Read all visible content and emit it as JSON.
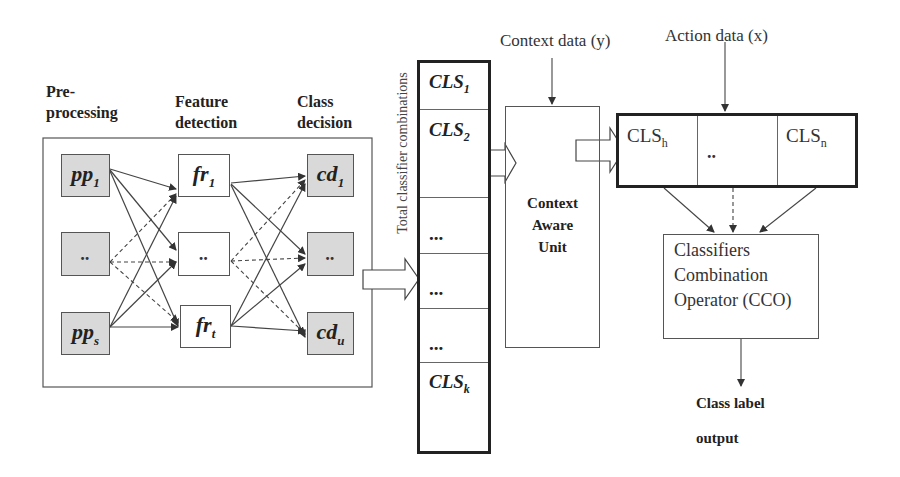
{
  "diagram": {
    "stage_labels": {
      "preprocessing_line1": "Pre-",
      "preprocessing_line2": "processing",
      "feature_line1": "Feature",
      "feature_line2": "detection",
      "class_line1": "Class",
      "class_line2": "decision"
    },
    "preprocessing_nodes": [
      {
        "base": "pp",
        "sub": "1"
      },
      {
        "base": "..",
        "sub": ""
      },
      {
        "base": "pp",
        "sub": "s"
      }
    ],
    "feature_nodes": [
      {
        "base": "fr",
        "sub": "1"
      },
      {
        "base": "..",
        "sub": ""
      },
      {
        "base": "fr",
        "sub": "t"
      }
    ],
    "decision_nodes": [
      {
        "base": "cd",
        "sub": "1"
      },
      {
        "base": "..",
        "sub": ""
      },
      {
        "base": "cd",
        "sub": "u"
      }
    ],
    "classifier_column": {
      "vertical_label": "Total classifier combinations",
      "cells": [
        {
          "base": "CLS",
          "sub": "1"
        },
        {
          "base": "CLS",
          "sub": "2"
        },
        {
          "base": "...",
          "sub": ""
        },
        {
          "base": "...",
          "sub": ""
        },
        {
          "base": "...",
          "sub": ""
        },
        {
          "base": "CLS",
          "sub": "k"
        }
      ]
    },
    "context_input_label": "Context data (y)",
    "action_input_label": "Action data (x)",
    "context_unit": {
      "line1": "Context",
      "line2": "Aware",
      "line3": "Unit"
    },
    "selected_classifiers": [
      {
        "base": "CLS",
        "sub": "h"
      },
      {
        "base": "..",
        "sub": ""
      },
      {
        "base": "CLS",
        "sub": "n"
      }
    ],
    "cco": {
      "line1": "Classifiers",
      "line2": "Combination",
      "line3": "Operator (CCO)"
    },
    "output": {
      "line1": "Class label",
      "line2": "output"
    }
  },
  "colors": {
    "node_fill_grey": "#d9d9d9",
    "stroke": "#444444",
    "text": "#222222"
  }
}
